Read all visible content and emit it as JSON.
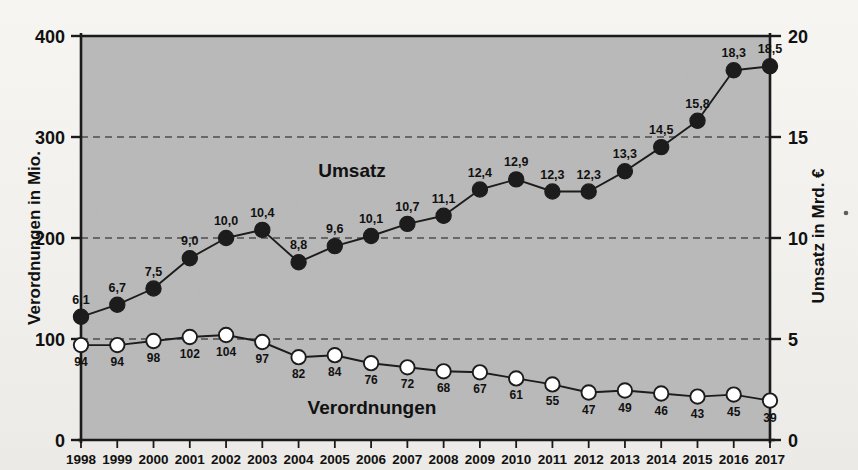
{
  "chart_data": {
    "type": "line",
    "title": "",
    "grid": true,
    "legend": "inline-labels",
    "x": [
      1998,
      1999,
      2000,
      2001,
      2002,
      2003,
      2004,
      2005,
      2006,
      2007,
      2008,
      2009,
      2010,
      2011,
      2012,
      2013,
      2014,
      2015,
      2016,
      2017
    ],
    "categories": [
      "1998",
      "1999",
      "2000",
      "2001",
      "2002",
      "2003",
      "2004",
      "2005",
      "2006",
      "2007",
      "2008",
      "2009",
      "2010",
      "2011",
      "2012",
      "2013",
      "2014",
      "2015",
      "2016",
      "2017"
    ],
    "xlabel": "",
    "left_axis": {
      "label": "Verordnungen in Mio.",
      "ticks": [
        "0",
        "100",
        "200",
        "300",
        "400"
      ],
      "tick_values": [
        0,
        100,
        200,
        300,
        400
      ],
      "ylim": [
        0,
        400
      ]
    },
    "right_axis": {
      "label": "Umsatz in Mrd. €",
      "ticks": [
        "0",
        "5",
        "10",
        "15",
        "20"
      ],
      "tick_values": [
        0,
        5,
        10,
        15,
        20
      ],
      "ylim": [
        0,
        20
      ]
    },
    "series": [
      {
        "name": "Umsatz",
        "axis": "right",
        "unit": "Mrd. €",
        "marker": "filled-circle",
        "color": "#1c1c1c",
        "values": [
          6.1,
          6.7,
          7.5,
          9.0,
          10.0,
          10.4,
          8.8,
          9.6,
          10.1,
          10.7,
          11.1,
          12.4,
          12.9,
          12.3,
          12.3,
          13.3,
          14.5,
          15.8,
          18.3,
          18.5
        ],
        "labels": [
          "6,1",
          "6,7",
          "7,5",
          "9,0",
          "10,0",
          "10,4",
          "8,8",
          "9,6",
          "10,1",
          "10,7",
          "11,1",
          "12,4",
          "12,9",
          "12,3",
          "12,3",
          "13,3",
          "14,5",
          "15,8",
          "18,3",
          "18,5"
        ]
      },
      {
        "name": "Verordnungen",
        "axis": "left",
        "unit": "Mio.",
        "marker": "open-circle",
        "color": "#ffffff",
        "values": [
          94,
          94,
          98,
          102,
          104,
          97,
          82,
          84,
          76,
          72,
          68,
          67,
          61,
          55,
          47,
          49,
          46,
          43,
          45,
          39
        ],
        "labels": [
          "94",
          "94",
          "98",
          "102",
          "104",
          "97",
          "82",
          "84",
          "76",
          "72",
          "68",
          "67",
          "61",
          "55",
          "47",
          "49",
          "46",
          "43",
          "45",
          "39"
        ]
      }
    ],
    "series_annotations": [
      {
        "name": "umsatz-annotation",
        "text": "Umsatz"
      },
      {
        "name": "verordnungen-annotation",
        "text": "Verordnungen"
      }
    ],
    "colors": {
      "plot_background": "#b9b9b9",
      "axis": "#1a1a1a",
      "gridline": "#4d4d4d",
      "dark_series": "#1c1c1c",
      "light_series": "#ffffff",
      "page_background": "#f2f1ed"
    }
  }
}
